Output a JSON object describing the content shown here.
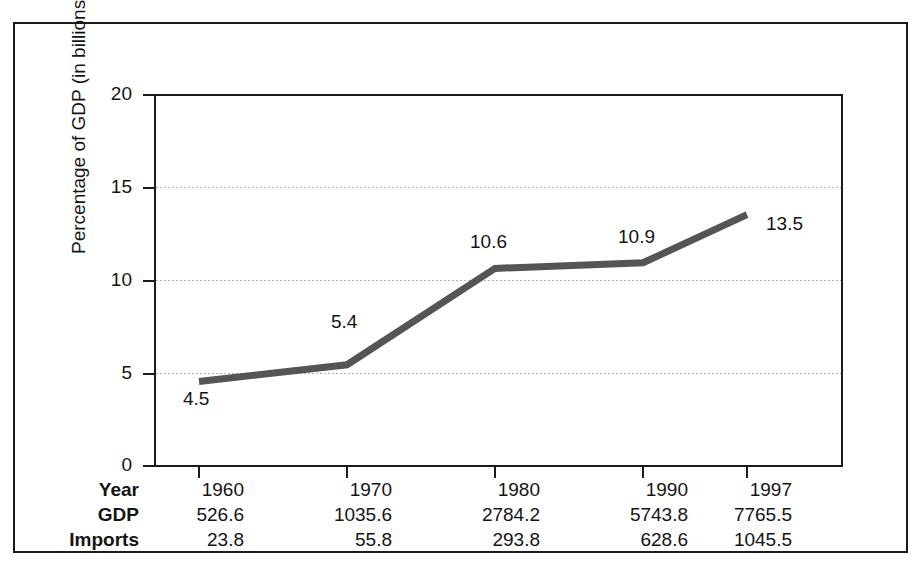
{
  "chart_data": {
    "type": "line",
    "title": "",
    "xlabel": "",
    "ylabel": "Percentage of GDP (in billions)",
    "categories": [
      "1960",
      "1970",
      "1980",
      "1990",
      "1997"
    ],
    "x": [
      1960,
      1970,
      1980,
      1990,
      1997
    ],
    "values": [
      4.5,
      5.4,
      10.6,
      10.9,
      13.5
    ],
    "point_labels": [
      "4.5",
      "5.4",
      "10.6",
      "10.9",
      "13.5"
    ],
    "ylim": [
      0,
      20
    ],
    "yticks": [
      0,
      5,
      10,
      15,
      20
    ],
    "ytick_labels": [
      "0",
      "5",
      "10",
      "15",
      "20"
    ],
    "grid": "horizontal-dotted",
    "legend": "none",
    "series": [
      {
        "name": "Imports as percentage of GDP",
        "values": [
          4.5,
          5.4,
          10.6,
          10.9,
          13.5
        ],
        "color": "#555555"
      }
    ],
    "table": {
      "rows": [
        {
          "label": "Year",
          "values": [
            "1960",
            "1970",
            "1980",
            "1990",
            "1997"
          ]
        },
        {
          "label": "GDP",
          "values": [
            "526.6",
            "1035.6",
            "2784.2",
            "5743.8",
            "7765.5"
          ]
        },
        {
          "label": "Imports",
          "values": [
            "23.8",
            "55.8",
            "293.8",
            "628.6",
            "1045.5"
          ]
        }
      ]
    }
  },
  "colors": {
    "line": "#555555",
    "axis": "#1b1b1b",
    "grid": "#b4b4b4",
    "text": "#141414",
    "background": "#ffffff"
  }
}
